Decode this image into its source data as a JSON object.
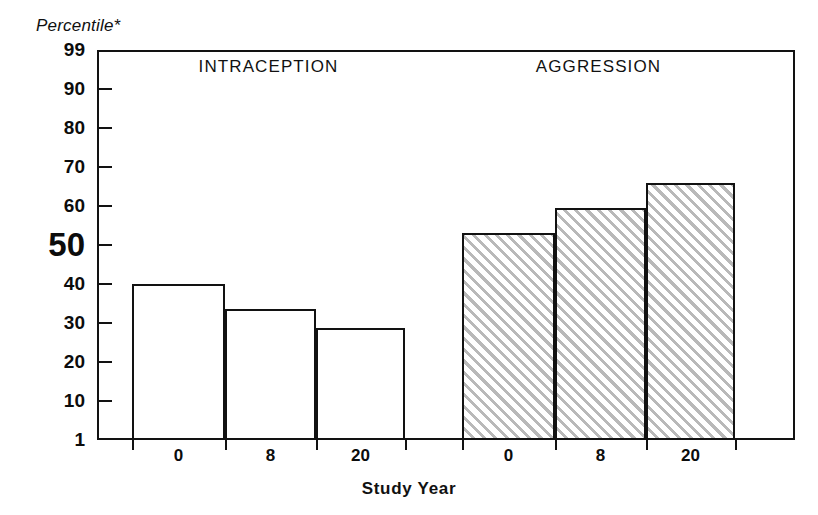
{
  "chart_data": {
    "type": "bar",
    "title": "",
    "subtitle": "",
    "ylabel": "Percentile*",
    "xlabel": "Study Year",
    "categories": [
      "0",
      "8",
      "20"
    ],
    "grid": false,
    "legend_position": "none",
    "y_axis": {
      "scale": "probit",
      "ticks": [
        "99",
        "90",
        "80",
        "70",
        "60",
        "50",
        "40",
        "30",
        "20",
        "10",
        "1"
      ],
      "tick_values": [
        99,
        90,
        80,
        70,
        60,
        50,
        40,
        30,
        20,
        10,
        1
      ],
      "emphasized_tick": "50",
      "ylim": [
        1,
        99
      ]
    },
    "groups": [
      {
        "name": "INTRACEPTION",
        "fill": "white",
        "categories": [
          "0",
          "8",
          "20"
        ],
        "values": [
          40,
          33.5,
          28.7
        ]
      },
      {
        "name": "AGGRESSION",
        "fill": "diagonal-hatch",
        "categories": [
          "0",
          "8",
          "20"
        ],
        "values": [
          53,
          59.5,
          66
        ]
      }
    ],
    "colors": {
      "axis": "#121212",
      "bar_outline": "#121212",
      "bar_fill_white": "#ffffff",
      "hatch_line": "#b9b9b9",
      "background": "#ffffff",
      "text": "#111111"
    }
  }
}
